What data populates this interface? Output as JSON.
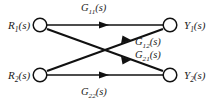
{
  "diagram": {
    "background_color": "#ffffff",
    "line_color": "#111111",
    "node_fill": "#ffffff",
    "nodes": [
      {
        "id": "R1",
        "role": "input",
        "base": "R",
        "sub": "1",
        "arg": "(s)",
        "cx": 40,
        "cy": 25
      },
      {
        "id": "R2",
        "role": "input",
        "base": "R",
        "sub": "2",
        "arg": "(s)",
        "cx": 40,
        "cy": 75
      },
      {
        "id": "Y1",
        "role": "output",
        "base": "Y",
        "sub": "1",
        "arg": "(s)",
        "cx": 170,
        "cy": 25
      },
      {
        "id": "Y2",
        "role": "output",
        "base": "Y",
        "sub": "2",
        "arg": "(s)",
        "cx": 170,
        "cy": 75
      }
    ],
    "edges": [
      {
        "id": "G11",
        "from": "R1",
        "to": "Y1",
        "base": "G",
        "sub": "11",
        "arg": "(s)"
      },
      {
        "id": "G12",
        "from": "R2",
        "to": "Y1",
        "base": "G",
        "sub": "12",
        "arg": "(s)"
      },
      {
        "id": "G21",
        "from": "R1",
        "to": "Y2",
        "base": "G",
        "sub": "21",
        "arg": "(s)"
      },
      {
        "id": "G22",
        "from": "R2",
        "to": "Y2",
        "base": "G",
        "sub": "22",
        "arg": "(s)"
      }
    ]
  }
}
